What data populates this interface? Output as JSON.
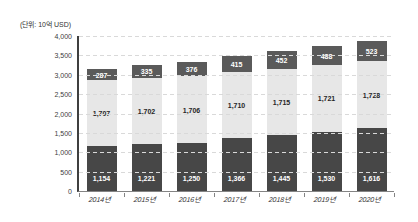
{
  "chart_data": {
    "type": "bar",
    "stacked": true,
    "title": "",
    "unit_label": "(단위: 10억 USD)",
    "categories": [
      "2014년",
      "2015년",
      "2016년",
      "2017년",
      "2018년",
      "2019년",
      "2020년"
    ],
    "series": [
      {
        "name": "segment-bottom",
        "values": [
          1154,
          1221,
          1250,
          1366,
          1445,
          1530,
          1616
        ],
        "labels": [
          "1,154",
          "1,221",
          "1,250",
          "1,366",
          "1,445",
          "1,530",
          "1,616"
        ],
        "color": "#474747",
        "label_color": "#ffffff",
        "label_position": "inside-base"
      },
      {
        "name": "segment-middle",
        "values": [
          1707,
          1702,
          1706,
          1710,
          1715,
          1721,
          1728
        ],
        "labels": [
          "1,707",
          "1,702",
          "1,706",
          "1,710",
          "1,715",
          "1,721",
          "1,728"
        ],
        "color": "#e7e7e7",
        "label_color": "#262626",
        "label_position": "center"
      },
      {
        "name": "segment-top",
        "values": [
          287,
          335,
          376,
          415,
          452,
          488,
          523
        ],
        "labels": [
          "287",
          "335",
          "376",
          "415",
          "452",
          "488",
          "523"
        ],
        "color": "#5a5a5a",
        "label_color": "#ffffff",
        "label_position": "center"
      }
    ],
    "ylim": [
      0,
      4000
    ],
    "y_tick_step": 500,
    "y_ticks": [
      "0",
      "500",
      "1,000",
      "1,500",
      "2,000",
      "2,500",
      "3,000",
      "3,500",
      "4,000"
    ],
    "grid": "horizontal-dashed",
    "legend": "none",
    "colors": {
      "grid": "#d9d9d9",
      "y_axis": "#3f3f3f",
      "x_axis": "#848484",
      "tick_text": "#404040"
    }
  }
}
